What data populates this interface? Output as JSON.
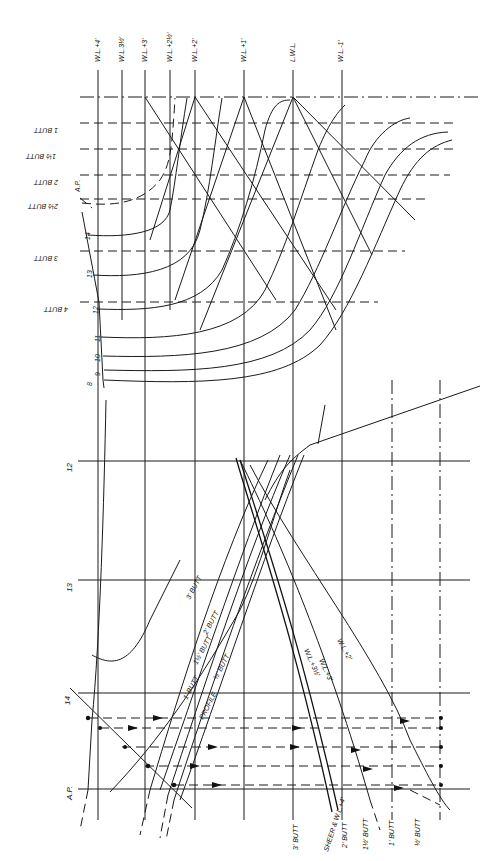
{
  "drawing": {
    "title": "Lines drawing – body plan, waterlines and buttock fairing",
    "ink_color": "#1a1a1a",
    "paper_color": "#ffffff"
  },
  "waterline_labels": [
    "W.L.+4'",
    "W.L.3½'",
    "W.L.+3'",
    "W.L.+2½'",
    "W.L.+2'",
    "W.L.+1'",
    "L.W.L.",
    "W.L.-1'"
  ],
  "body_plan_buttock_labels": [
    "4 BUTT",
    "3 BUTT",
    "2½ BUTT",
    "2 BUTT",
    "1½ BUTT",
    "1 BUTT"
  ],
  "station_numbers_body_plan": [
    "A.P.",
    "14",
    "13",
    "12",
    "11",
    "10",
    "9",
    "8"
  ],
  "station_labels_profile": [
    "12",
    "13",
    "14",
    "A.P."
  ],
  "profile_curve_labels": [
    "3' BUTT",
    "2' BUTT",
    "1½' BUTT",
    "1' BUTT",
    "½' BUTT",
    "PROFILE"
  ],
  "waterline_curve_labels": [
    "W.L.+2'",
    "W.L.+3'",
    "W.L.+3½'"
  ],
  "bottom_labels": [
    "3' BUTT",
    "SHEER & W.L.+4'",
    "2' BUTT",
    "1½' BUTT",
    "1' BUTT",
    "½' BUTT"
  ]
}
